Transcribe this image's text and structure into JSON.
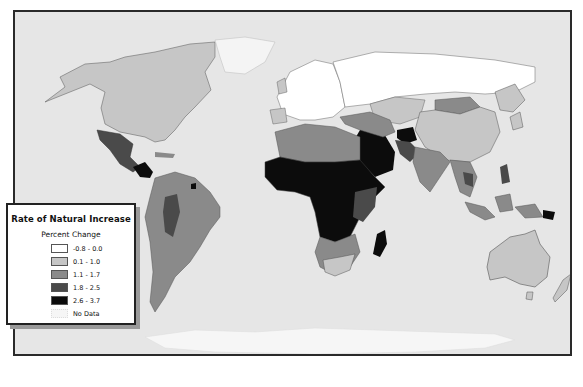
{
  "map": {
    "title": "World map: Rate of Natural Increase",
    "background_color": "#e6e6e6",
    "ocean_color": "#e6e6e6",
    "border_color": "#2a2a2a"
  },
  "legend": {
    "title": "Rate of Natural Increase",
    "subtitle": "Percent Change",
    "items": [
      {
        "label": "-0.8 - 0.0",
        "color": "#ffffff"
      },
      {
        "label": "0.1 - 1.0",
        "color": "#c6c6c6"
      },
      {
        "label": "1.1 - 1.7",
        "color": "#8a8a8a"
      },
      {
        "label": "1.8 - 2.5",
        "color": "#4a4a4a"
      },
      {
        "label": "2.6 - 3.7",
        "color": "#0c0c0c"
      },
      {
        "label": "No Data",
        "color": "#f2f2f2"
      }
    ]
  },
  "regions": {
    "north_america": "0.1 - 1.0",
    "greenland": "-0.8 - 0.0",
    "mexico": "1.8 - 2.5",
    "central_america": "2.6 - 3.7",
    "south_america": "1.1 - 1.7",
    "europe": "-0.8 - 0.0",
    "russia": "-0.8 - 0.0",
    "north_africa": "1.1 - 1.7",
    "sub_saharan_africa": "2.6 - 3.7",
    "southern_africa": "0.1 - 1.0",
    "madagascar": "2.6 - 3.7",
    "middle_east": "2.6 - 3.7",
    "afghanistan": "2.6 - 3.7",
    "south_asia": "1.1 - 1.7",
    "china": "0.1 - 1.0",
    "mongolia": "1.1 - 1.7",
    "southeast_asia": "1.1 - 1.7",
    "australia": "0.1 - 1.0",
    "antarctica": "No Data"
  },
  "caption": ""
}
